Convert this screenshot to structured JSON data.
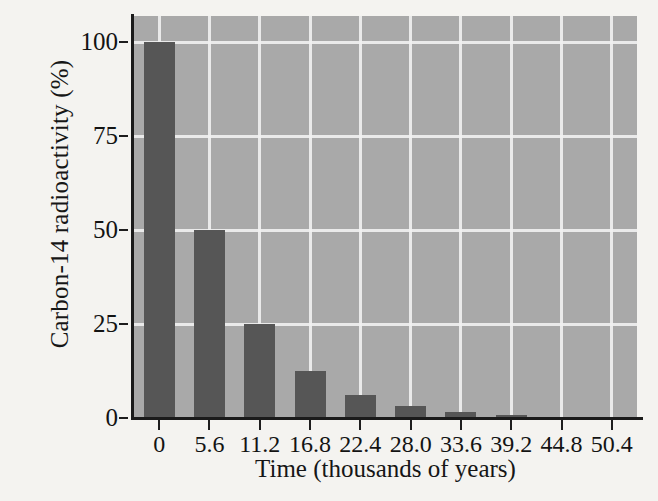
{
  "chart_data": {
    "type": "bar",
    "title": "",
    "xlabel": "Time (thousands of years)",
    "ylabel": "Carbon-14 radioactivity (%)",
    "categories": [
      "0",
      "5.6",
      "11.2",
      "16.8",
      "22.4",
      "28.0",
      "33.6",
      "39.2",
      "44.8",
      "50.4"
    ],
    "values": [
      100,
      50,
      25,
      12.5,
      6.25,
      3.125,
      1.5625,
      0.78,
      0.39,
      0.195
    ],
    "xlim": [
      -2.8,
      53.2
    ],
    "ylim": [
      0,
      107
    ],
    "ytick_labels": [
      "0",
      "25",
      "50",
      "75",
      "100"
    ],
    "ytick_values": [
      0,
      25,
      50,
      75,
      100
    ],
    "xtick_labels": [
      "0",
      "5.6",
      "11.2",
      "16.8",
      "22.4",
      "28.0",
      "33.6",
      "39.2",
      "44.8",
      "50.4"
    ],
    "grid": "white gridlines on gray panel",
    "legend": "none",
    "bar_color": "#565656",
    "panel_color": "#a9a9a9",
    "gridline_color": "#f0f0f0",
    "axis_color": "#1b1b1b",
    "background_color": "#f4f3f0"
  }
}
